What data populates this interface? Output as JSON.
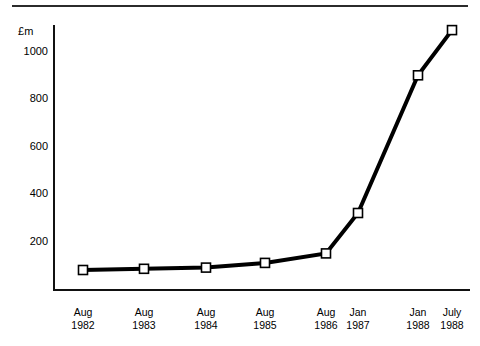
{
  "chart_data": {
    "type": "line",
    "title": "",
    "subtitle": "",
    "xlabel": "",
    "ylabel": "£m",
    "unit_caption": "£m",
    "categories": [
      "Aug 1982",
      "Aug 1983",
      "Aug 1984",
      "Aug 1985",
      "Aug 1986",
      "Jan 1987",
      "Jan 1988",
      "July 1988"
    ],
    "category_lines": [
      {
        "line1": "Aug",
        "line2": "1982"
      },
      {
        "line1": "Aug",
        "line2": "1983"
      },
      {
        "line1": "Aug",
        "line2": "1984"
      },
      {
        "line1": "Aug",
        "line2": "1985"
      },
      {
        "line1": "Aug",
        "line2": "1986"
      },
      {
        "line1": "Jan",
        "line2": "1987"
      },
      {
        "line1": "Jan",
        "line2": "1988"
      },
      {
        "line1": "July",
        "line2": "1988"
      }
    ],
    "values": [
      80,
      85,
      90,
      110,
      150,
      320,
      900,
      1090
    ],
    "series": [
      {
        "name": "",
        "values": [
          80,
          85,
          90,
          110,
          150,
          320,
          900,
          1090
        ]
      }
    ],
    "ylim": [
      0,
      1120
    ],
    "yticks": [
      200,
      400,
      600,
      800,
      1000
    ],
    "ytick_labels": [
      "200",
      "400",
      "600",
      "800",
      "1000"
    ],
    "grid": false,
    "legend": false,
    "legend_position": "none",
    "marker_style": "open-square",
    "line_color": "#000000",
    "marker_fill_color": "#ffffff",
    "axis_color": "#111111"
  },
  "layout": {
    "plot_left_px": 53,
    "plot_baseline_px": 289,
    "plot_top_px": 25,
    "plot_right_px": 470,
    "px_per_unit": 0.2375,
    "category_x_px": [
      83,
      144,
      206,
      265,
      326,
      358,
      418,
      452
    ],
    "ytick_y_px": [
      242,
      194,
      147,
      99,
      52
    ]
  }
}
